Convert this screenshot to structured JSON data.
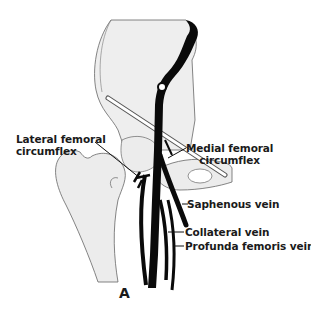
{
  "diagram": {
    "figure_label": "A",
    "labels": {
      "lateral_femoral_circumflex": [
        "Lateral femoral",
        "circumflex"
      ],
      "medial_femoral_circumflex": [
        "Medial femoral",
        "circumflex"
      ],
      "saphenous_vein": "Saphenous vein",
      "collateral_vein": "Collateral vein",
      "profunda_femoris_vein": "Profunda femoris vein"
    },
    "colors": {
      "vein": "#0a0a0a",
      "bone_fill": "#ececec",
      "outline": "#555555",
      "text": "#1a1a1a"
    }
  }
}
